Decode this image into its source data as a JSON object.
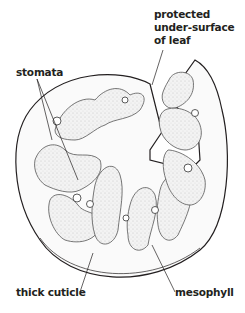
{
  "diagram": {
    "labels": {
      "protected_line1": "protected",
      "protected_line2": "under-surface",
      "protected_line3": "of leaf",
      "stomata": "stomata",
      "thick_cuticle": "thick cuticle",
      "mesophyll": "mesophyll"
    },
    "colors": {
      "ink": "#231f20",
      "fill": "#f2f2f2",
      "background": "#ffffff"
    }
  }
}
